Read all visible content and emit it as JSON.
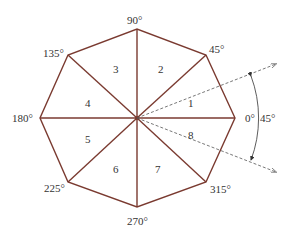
{
  "diagram": {
    "colors": {
      "edge": "#7a3a30",
      "dashed": "#555555",
      "text": "#333333"
    },
    "center": [
      137,
      118
    ],
    "vertices": [
      {
        "angle_label": "0°",
        "x": 235,
        "y": 118,
        "lx": 245,
        "ly": 122
      },
      {
        "angle_label": "45°",
        "x": 206,
        "y": 55,
        "lx": 209,
        "ly": 53
      },
      {
        "angle_label": "90°",
        "x": 137,
        "y": 29,
        "lx": 127,
        "ly": 24
      },
      {
        "angle_label": "135°",
        "x": 68,
        "y": 55,
        "lx": 43,
        "ly": 57
      },
      {
        "angle_label": "180°",
        "x": 40,
        "y": 118,
        "lx": 12,
        "ly": 122
      },
      {
        "angle_label": "225°",
        "x": 68,
        "y": 182,
        "lx": 44,
        "ly": 192
      },
      {
        "angle_label": "270°",
        "x": 137,
        "y": 207,
        "lx": 127,
        "ly": 225
      },
      {
        "angle_label": "315°",
        "x": 206,
        "y": 182,
        "lx": 210,
        "ly": 193
      }
    ],
    "sectors": [
      {
        "label": "1",
        "x": 188,
        "y": 107
      },
      {
        "label": "2",
        "x": 158,
        "y": 73
      },
      {
        "label": "3",
        "x": 113,
        "y": 73
      },
      {
        "label": "4",
        "x": 85,
        "y": 107
      },
      {
        "label": "5",
        "x": 85,
        "y": 143
      },
      {
        "label": "6",
        "x": 113,
        "y": 173
      },
      {
        "label": "7",
        "x": 155,
        "y": 173
      },
      {
        "label": "8",
        "x": 188,
        "y": 139
      }
    ],
    "angle_annotation": {
      "label": "45°",
      "x": 260,
      "y": 122
    }
  }
}
